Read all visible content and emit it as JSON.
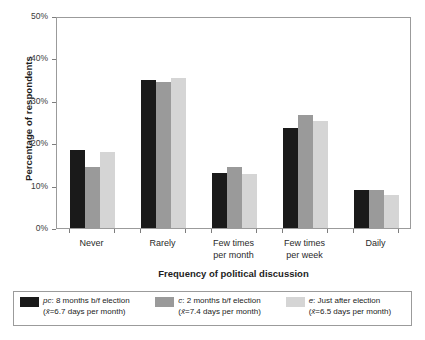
{
  "chart_data": {
    "type": "bar",
    "title": "",
    "xlabel": "Frequency of political discussion",
    "ylabel": "Percentage of respondents",
    "categories": [
      "Never",
      "Rarely",
      "Few times per month",
      "Few times per week",
      "Daily"
    ],
    "category_labels": [
      {
        "line1": "Never",
        "line2": ""
      },
      {
        "line1": "Rarely",
        "line2": ""
      },
      {
        "line1": "Few times",
        "line2": "per month"
      },
      {
        "line1": "Few times",
        "line2": "per week"
      },
      {
        "line1": "Daily",
        "line2": ""
      }
    ],
    "series": [
      {
        "name": "pc: 8 months b/f election",
        "color": "#1a1a1a",
        "values": [
          18.5,
          35.0,
          12.9,
          23.6,
          9.0
        ]
      },
      {
        "name": "c: 2 months b/f election",
        "color": "#9a9a9a",
        "values": [
          14.3,
          34.5,
          14.3,
          26.7,
          9.0
        ]
      },
      {
        "name": "e: Just after election",
        "color": "#d5d5d5",
        "values": [
          17.9,
          35.3,
          12.7,
          25.2,
          7.8
        ]
      }
    ],
    "ylim": [
      0,
      50
    ],
    "ytick_values": [
      0,
      10,
      20,
      30,
      40,
      50
    ],
    "ytick_labels": [
      "0%",
      "10%",
      "20%",
      "30%",
      "40%",
      "50%"
    ],
    "grid": false,
    "legend_position": "below-axes"
  },
  "legend": {
    "items": [
      {
        "key": "pc",
        "key_label": "pc",
        "description": ": 8 months b/f election",
        "mean_line": "(x̄=6.7 days per month)",
        "mean_symbol": "x̄",
        "mean_value": "6.7",
        "mean_unit": "days per month",
        "color": "#1a1a1a",
        "swatch_name": "legend-swatch-pc"
      },
      {
        "key": "c",
        "key_label": "c",
        "description": ": 2 months b/f election",
        "mean_line": "(x̄=7.4 days per month)",
        "mean_symbol": "x̄",
        "mean_value": "7.4",
        "mean_unit": "days per month",
        "color": "#9a9a9a",
        "swatch_name": "legend-swatch-c"
      },
      {
        "key": "e",
        "key_label": "e",
        "description": ": Just after election",
        "mean_line": "(x̄=6.5 days per month)",
        "mean_symbol": "x̄",
        "mean_value": "6.5",
        "mean_unit": "days per month",
        "color": "#d5d5d5",
        "swatch_name": "legend-swatch-e"
      }
    ]
  },
  "axes": {
    "y_title": "Percentage of respondents",
    "x_title": "Frequency of political discussion",
    "frame_color": "#9b9b9b",
    "tick_color": "#7d7d7d"
  }
}
